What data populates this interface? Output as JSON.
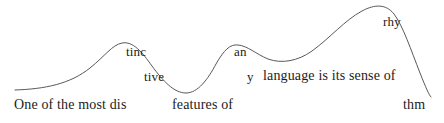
{
  "figure": {
    "name": "speech-rhythm-contour",
    "full_sentence": "One of the most distinctive features of any language is its sense of rhythm",
    "background_color": "#ffffff",
    "curve_color": "#595959",
    "text_color": "#1b1b1b"
  },
  "labels": [
    {
      "id": "one-of-the-most-dis",
      "text": "One of the most dis",
      "x": 14,
      "y": 98,
      "size": 14
    },
    {
      "id": "tinc",
      "text": "tinc",
      "x": 126,
      "y": 45,
      "size": 13
    },
    {
      "id": "tive",
      "text": "tive",
      "x": 144,
      "y": 70,
      "size": 13
    },
    {
      "id": "features-of",
      "text": "features of",
      "x": 172,
      "y": 98,
      "size": 14
    },
    {
      "id": "an",
      "text": "an",
      "x": 234,
      "y": 45,
      "size": 13
    },
    {
      "id": "y",
      "text": "y",
      "x": 247,
      "y": 70,
      "size": 13
    },
    {
      "id": "language-is-its-sense-of",
      "text": "language is its sense of",
      "x": 263,
      "y": 69,
      "size": 14
    },
    {
      "id": "rhy",
      "text": "rhy",
      "x": 383,
      "y": 15,
      "size": 13
    },
    {
      "id": "thm",
      "text": "thm",
      "x": 403,
      "y": 98,
      "size": 14
    }
  ],
  "chart_data": {
    "type": "line",
    "title": "",
    "xlabel": "",
    "ylabel": "",
    "grid": false,
    "legend": false,
    "xlim": [
      0,
      444
    ],
    "ylim": [
      123,
      0
    ],
    "series": [
      {
        "name": "pitch-contour",
        "color": "#595959",
        "path": "M 15 90 C 45 89, 70 84, 90 68 C 105 56, 112 45, 122 43 C 133 41, 142 52, 152 66 C 163 81, 174 93, 186 93 C 198 93, 208 79, 216 64 C 224 50, 230 44, 238 45 C 248 46, 256 54, 268 59 C 282 64, 298 61, 312 51 C 330 38, 345 20, 362 11 C 375 4, 386 4, 394 14 C 403 26, 411 50, 420 73 C 426 88, 429 95, 431 97",
        "points": [
          {
            "x": 15,
            "y": 90
          },
          {
            "x": 90,
            "y": 68
          },
          {
            "x": 122,
            "y": 43
          },
          {
            "x": 152,
            "y": 66
          },
          {
            "x": 186,
            "y": 93
          },
          {
            "x": 216,
            "y": 64
          },
          {
            "x": 238,
            "y": 45
          },
          {
            "x": 268,
            "y": 59
          },
          {
            "x": 298,
            "y": 60
          },
          {
            "x": 340,
            "y": 30
          },
          {
            "x": 378,
            "y": 8
          },
          {
            "x": 394,
            "y": 14
          },
          {
            "x": 420,
            "y": 73
          },
          {
            "x": 431,
            "y": 97
          }
        ]
      }
    ]
  }
}
